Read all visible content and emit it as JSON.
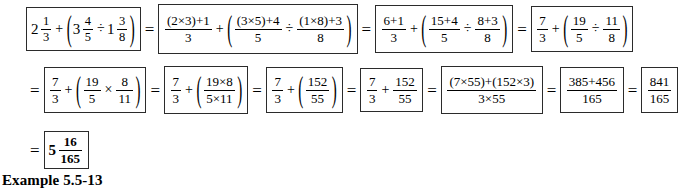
{
  "document": {
    "caption": "Example 5.5-13",
    "equals_sign": "=",
    "plus_sign": "+",
    "times_sign": "×",
    "divide_sign": "÷",
    "paren_open": "(",
    "paren_close": ")"
  },
  "rows": [
    {
      "id": "row-1",
      "steps": [
        {
          "label": "original-mixed-number-expression",
          "text": "2 1/3 + ( 3 4/5 ÷ 1 3/8 )",
          "parts": {
            "whole_1": "2",
            "num_1": "1",
            "den_1": "3",
            "whole_2": "3",
            "num_2": "4",
            "den_2": "5",
            "whole_3": "1",
            "num_3": "3",
            "den_3": "8"
          }
        },
        {
          "label": "expanded-to-improper-fractions",
          "text": "((2×3)+1)/3 + ( ((3×5)+4)/5 ÷ ((1×8)+3)/8 )",
          "parts": {
            "num_1": "(2×3)+1",
            "den_1": "3",
            "num_2": "(3×5)+4",
            "den_2": "5",
            "num_3": "(1×8)+3",
            "den_3": "8"
          }
        },
        {
          "label": "partial-products-evaluated",
          "text": "(6+1)/3 + ( (15+4)/5 ÷ (8+3)/8 )",
          "parts": {
            "num_1": "6+1",
            "den_1": "3",
            "num_2": "15+4",
            "den_2": "5",
            "num_3": "8+3",
            "den_3": "8"
          }
        },
        {
          "label": "improper-fractions-simplified",
          "text": "7/3 + ( 19/5 ÷ 11/8 )",
          "parts": {
            "num_1": "7",
            "den_1": "3",
            "num_2": "19",
            "den_2": "5",
            "num_3": "11",
            "den_3": "8"
          }
        }
      ]
    },
    {
      "id": "row-2",
      "steps": [
        {
          "label": "division-changed-to-multiplication",
          "text": "7/3 + ( 19/5 × 8/11 )",
          "parts": {
            "num_1": "7",
            "den_1": "3",
            "num_2": "19",
            "den_2": "5",
            "num_3": "8",
            "den_3": "11"
          }
        },
        {
          "label": "numerators-and-denominators-combined",
          "text": "7/3 + ( (19×8)/(5×11) )",
          "parts": {
            "num_1": "7",
            "den_1": "3",
            "num_2": "19×8",
            "den_2": "5×11"
          }
        },
        {
          "label": "product-evaluated-in-parentheses",
          "text": "7/3 + ( 152/55 )",
          "parts": {
            "num_1": "7",
            "den_1": "3",
            "num_2": "152",
            "den_2": "55"
          }
        },
        {
          "label": "parentheses-removed",
          "text": "7/3 + 152/55",
          "parts": {
            "num_1": "7",
            "den_1": "3",
            "num_2": "152",
            "den_2": "55"
          }
        },
        {
          "label": "cross-multiplied-common-denominator",
          "text": "((7×55)+(152×3))/(3×55)",
          "parts": {
            "num_1": "(7×55)+(152×3)",
            "den_1": "3×55"
          }
        },
        {
          "label": "products-evaluated",
          "text": "(385+456)/165",
          "parts": {
            "num_1": "385+456",
            "den_1": "165"
          }
        },
        {
          "label": "improper-fraction-result",
          "text": "841/165",
          "parts": {
            "num_1": "841",
            "den_1": "165"
          }
        }
      ]
    },
    {
      "id": "row-3",
      "steps": [
        {
          "label": "final-mixed-number-answer",
          "text": "5 16/165",
          "parts": {
            "whole_1": "5",
            "num_1": "16",
            "den_1": "165"
          }
        }
      ]
    }
  ]
}
